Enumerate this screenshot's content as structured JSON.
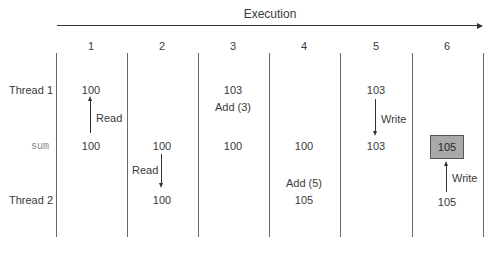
{
  "title": "Execution",
  "columns": [
    "1",
    "2",
    "3",
    "4",
    "5",
    "6"
  ],
  "rows": {
    "thread1": "Thread 1",
    "sum": "sum",
    "thread2": "Thread 2"
  },
  "cells": {
    "c1": {
      "thread1": "100",
      "sum": "100",
      "arrow_label": "Read"
    },
    "c2": {
      "sum": "100",
      "thread2": "100",
      "arrow_label": "Read"
    },
    "c3": {
      "thread1": "103",
      "op": "Add (3)",
      "sum": "100"
    },
    "c4": {
      "sum": "100",
      "op": "Add (5)",
      "thread2": "105"
    },
    "c5": {
      "thread1": "103",
      "sum": "103",
      "arrow_label": "Write"
    },
    "c6": {
      "sum": "105",
      "thread2": "105",
      "arrow_label": "Write"
    }
  },
  "colors": {
    "highlight_box": "#a9a9a9",
    "lines": "#6a6a6a",
    "text": "#3a3a3a"
  }
}
